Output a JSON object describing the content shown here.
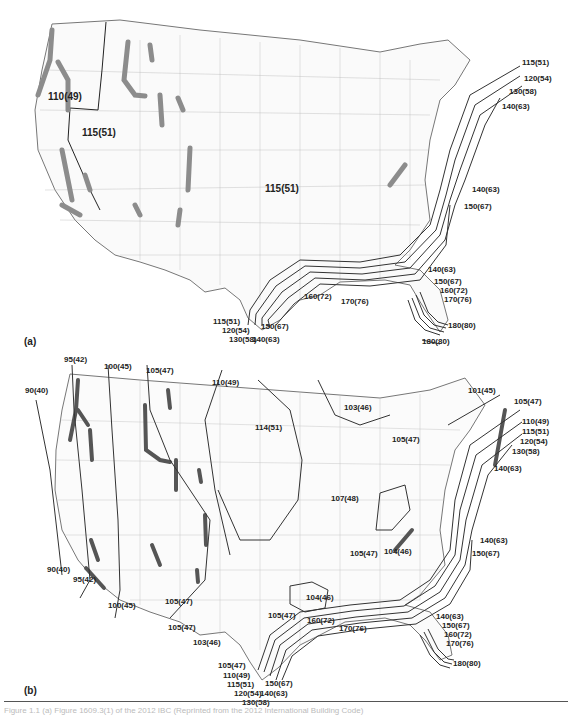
{
  "figure": {
    "panel_a": {
      "letter": "(a)",
      "region_labels": [
        "110(49)",
        "115(51)",
        "115(51)"
      ],
      "contour_labels": {
        "northeast": [
          "115(51)",
          "120(54)",
          "130(58)",
          "140(63)"
        ],
        "mid_atlantic": [
          "140(63)",
          "150(67)"
        ],
        "florida": [
          "140(63)",
          "150(67)",
          "160(72)",
          "170(76)",
          "180(80)",
          "180(80)"
        ],
        "gulf": [
          "160(72)",
          "170(76)"
        ],
        "texas": [
          "115(51)",
          "120(54)",
          "130(58)",
          "140(63)",
          "150(67)"
        ]
      }
    },
    "panel_b": {
      "letter": "(b)",
      "contour_labels": {
        "west": [
          "90(40)",
          "95(42)",
          "100(45)",
          "105(47)",
          "110(49)",
          "95(42)",
          "90(40)",
          "100(45)",
          "105(47)",
          "105(47)",
          "103(46)"
        ],
        "central": [
          "114(51)",
          "103(46)",
          "105(47)",
          "107(48)",
          "105(47)",
          "104(46)",
          "104(46)",
          "105(47)"
        ],
        "northeast": [
          "101(45)",
          "105(47)",
          "110(49)",
          "115(51)",
          "120(54)",
          "130(58)",
          "140(63)"
        ],
        "mid_atlantic": [
          "140(63)",
          "150(67)"
        ],
        "gulf": [
          "160(72)",
          "170(76)"
        ],
        "florida": [
          "140(63)",
          "150(67)",
          "160(72)",
          "170(76)",
          "180(80)"
        ],
        "texas": [
          "105(47)",
          "110(49)",
          "115(51)",
          "120(54)",
          "130(58)",
          "140(63)",
          "150(67)"
        ]
      }
    },
    "caption": "Figure 1.1  (a) Figure 1609.3(1) of the 2012 IBC (Reprinted from the 2012 International Building Code)"
  },
  "colors": {
    "contour": "#333333",
    "county_lines": "#9a9a9a",
    "special_region": "#8c8c8c",
    "background": "#ffffff"
  }
}
